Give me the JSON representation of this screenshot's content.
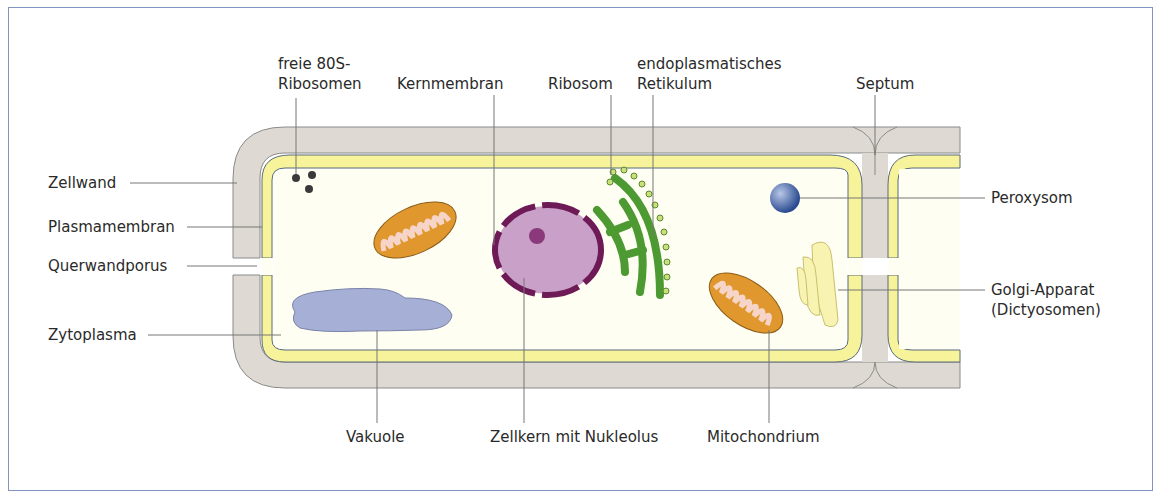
{
  "diagram": {
    "type": "plant-cell-cross-section",
    "colors": {
      "cell_wall": "#dedad3",
      "membrane_yellow": "#f6f39a",
      "cytoplasm": "#fffef2",
      "vacuole": "#a6b0d6",
      "nucleus": "#c9a0c8",
      "nuclear_membrane": "#6e1a57",
      "er": "#4e9a32",
      "mitochondrion": "#e0982e",
      "peroxisome": "#34559a",
      "golgi": "#f8f3b0",
      "frame": "#7f95c0"
    },
    "labels": {
      "ribosomes_free": "freie 80S-\nRibosomen",
      "nuclear_membrane": "Kernmembran",
      "ribosome": "Ribosom",
      "er": "endoplasmatisches\nRetikulum",
      "septum": "Septum",
      "cell_wall": "Zellwand",
      "plasma_membrane": "Plasmamembran",
      "cross_wall_pore": "Querwandporus",
      "cytoplasm": "Zytoplasma",
      "peroxisome": "Peroxysom",
      "golgi": "Golgi-Apparat\n(Dictyosomen)",
      "vacuole": "Vakuole",
      "nucleus": "Zellkern mit Nukleolus",
      "mitochondrion": "Mitochondrium"
    }
  }
}
